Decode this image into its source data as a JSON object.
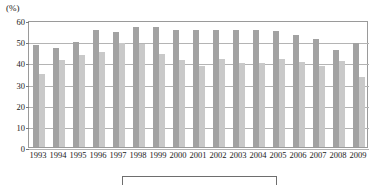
{
  "chart_data": {
    "type": "bar",
    "title": "",
    "subtitle": "",
    "xlabel": "",
    "ylabel": "(%)",
    "unit_label": "(%)",
    "ylim": [
      0,
      60
    ],
    "yticks": [
      0,
      10,
      20,
      30,
      40,
      50,
      60
    ],
    "ytick_labels": [
      "0",
      "10",
      "20",
      "30",
      "40",
      "50",
      "60"
    ],
    "grid": true,
    "grid_axis": "y",
    "legend_position": "bottom",
    "legend": [],
    "categories": [
      "1993",
      "1994",
      "1995",
      "1996",
      "1997",
      "1998",
      "1999",
      "2000",
      "2001",
      "2002",
      "2003",
      "2004",
      "2005",
      "2006",
      "2007",
      "2008",
      "2009"
    ],
    "series": [
      {
        "name": "series-1",
        "color": "#a2a2a2",
        "values": [
          48.0,
          47.0,
          49.5,
          55.5,
          54.5,
          56.5,
          56.5,
          55.5,
          55.5,
          55.5,
          55.5,
          55.5,
          55.0,
          53.0,
          51.0,
          46.0,
          49.0
        ]
      },
      {
        "name": "series-2",
        "color": "#c9c9c9",
        "values": [
          34.5,
          41.0,
          43.5,
          45.0,
          49.0,
          48.5,
          44.0,
          41.0,
          38.5,
          41.5,
          39.5,
          39.5,
          41.5,
          40.0,
          38.5,
          40.5,
          33.0
        ]
      }
    ]
  }
}
